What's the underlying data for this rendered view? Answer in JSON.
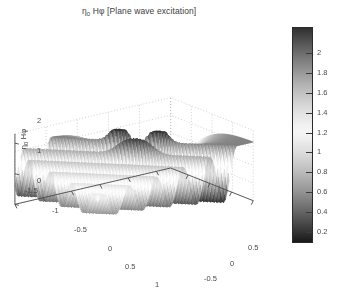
{
  "figure": {
    "title_main": "Hφ [Plane wave excitation]",
    "title_prefix": "η",
    "title_prefix_sub": "0",
    "background_color": "#ffffff",
    "axis_color": "#4a4a4a",
    "grid_color": "#b0b0b0"
  },
  "chart_data": {
    "type": "surface",
    "xlabel": "x",
    "ylabel": "y",
    "zlabel": "η₀ Hφ",
    "colormap": "gray-inverted-v",
    "grid": true,
    "legend": "none",
    "xlim": [
      -1.5,
      1.25
    ],
    "ylim": [
      -1.0,
      0.9
    ],
    "zlim": [
      0,
      2.3
    ],
    "clim": [
      0.1,
      2.25
    ],
    "xticks": [
      -1.5,
      -1,
      -0.5,
      0,
      0.5,
      1
    ],
    "xticklabels": [
      "-1.5",
      "-1",
      "-0.5",
      "0",
      "0.5",
      "1"
    ],
    "yticks": [
      -1,
      -0.5,
      0,
      0.5
    ],
    "yticklabels": [
      "-1",
      "-0.5",
      "0",
      "0.5"
    ],
    "zticks": [
      0,
      1,
      2
    ],
    "zticklabels": [
      "0",
      "1",
      "2"
    ],
    "colorbar_ticks": [
      0.2,
      0.4,
      0.6,
      0.8,
      1,
      1.2,
      1.4,
      1.6,
      1.8,
      2
    ],
    "colorbar_ticklabels": [
      "0.2",
      "0.4",
      "0.6",
      "0.8",
      "1",
      "1.2",
      "1.4",
      "1.6",
      "1.8",
      "2"
    ],
    "view_azimuth_deg": -37.5,
    "view_elevation_deg": 30,
    "surface_model": {
      "kind": "cylinder-scattering",
      "k": 9.2,
      "cylinder_radius": 0.28,
      "incident_amplitude": 1.0,
      "shadow_decay": 2.6,
      "ridge_count": 4,
      "peak_value": 2.25,
      "min_value": 0.05,
      "nx": 84,
      "ny": 84
    }
  },
  "ticks": {
    "x": [
      {
        "label": "-1.5",
        "left": 17,
        "top": 165
      },
      {
        "label": "-1",
        "left": 44,
        "top": 185
      },
      {
        "label": "-0.5",
        "left": 66,
        "top": 204
      },
      {
        "label": "0",
        "left": 100,
        "top": 223
      },
      {
        "label": "0.5",
        "left": 117,
        "top": 241
      },
      {
        "label": "1",
        "left": 147,
        "top": 259
      }
    ],
    "y": [
      {
        "label": "-1",
        "left": 170,
        "top": 267
      },
      {
        "label": "-0.5",
        "left": 196,
        "top": 253
      },
      {
        "label": "0",
        "left": 222,
        "top": 238
      },
      {
        "label": "0.5",
        "left": 240,
        "top": 222
      }
    ],
    "z": [
      {
        "label": "2",
        "left": 29,
        "top": 95
      },
      {
        "label": "1",
        "left": 29,
        "top": 125
      },
      {
        "label": "0",
        "left": 29,
        "top": 155
      }
    ]
  },
  "axis_labels": {
    "x": {
      "text": "x",
      "left": 110,
      "top": 275
    },
    "y": {
      "text": "y",
      "left": 216,
      "top": 272
    },
    "z": {
      "text_prefix": "η",
      "text_sub": "0",
      "text_main": "Hφ"
    }
  },
  "colorbar": {
    "min": 0.1,
    "max": 2.25,
    "ticks": [
      {
        "label": "2",
        "value": 2.0
      },
      {
        "label": "1.8",
        "value": 1.8
      },
      {
        "label": "1.6",
        "value": 1.6
      },
      {
        "label": "1.4",
        "value": 1.4
      },
      {
        "label": "1.2",
        "value": 1.2
      },
      {
        "label": "1",
        "value": 1.0
      },
      {
        "label": "0.8",
        "value": 0.8
      },
      {
        "label": "0.6",
        "value": 0.6
      },
      {
        "label": "0.4",
        "value": 0.4
      },
      {
        "label": "0.2",
        "value": 0.2
      }
    ]
  }
}
